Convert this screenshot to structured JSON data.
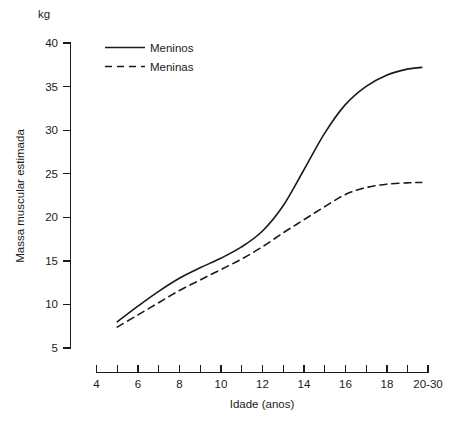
{
  "chart_data": {
    "type": "line",
    "title": "",
    "subtitle": "",
    "unit_label": "kg",
    "xlabel": "Idade (anos)",
    "ylabel": "Massa muscular estimada",
    "xlim": [
      4,
      20
    ],
    "ylim": [
      5,
      40
    ],
    "grid": false,
    "legend_position": "top-left-inside",
    "y_ticks": [
      5,
      10,
      15,
      20,
      25,
      30,
      35,
      40
    ],
    "y_tick_labels": [
      "5",
      "10",
      "15",
      "20",
      "25",
      "30",
      "35",
      "40"
    ],
    "x_ticks": [
      4,
      5,
      6,
      7,
      8,
      9,
      10,
      11,
      12,
      13,
      14,
      15,
      16,
      17,
      18,
      19,
      20
    ],
    "x_tick_labels": [
      "4",
      "",
      "6",
      "",
      "8",
      "",
      "10",
      "",
      "12",
      "",
      "14",
      "",
      "16",
      "",
      "18",
      "",
      "20-30"
    ],
    "x": [
      5,
      6,
      7,
      8,
      9,
      10,
      11,
      12,
      13,
      14,
      15,
      16,
      17,
      18,
      19,
      19.7
    ],
    "series": [
      {
        "name": "Meninos",
        "style": "solid",
        "color": "#1a1a1a",
        "values": [
          8.0,
          9.8,
          11.5,
          13.0,
          14.2,
          15.3,
          16.6,
          18.4,
          21.3,
          25.4,
          29.6,
          32.9,
          35.0,
          36.3,
          37.0,
          37.2
        ]
      },
      {
        "name": "Meninas",
        "style": "dashed",
        "color": "#1a1a1a",
        "values": [
          7.4,
          8.8,
          10.2,
          11.6,
          12.8,
          14.0,
          15.2,
          16.6,
          18.2,
          19.7,
          21.2,
          22.6,
          23.4,
          23.8,
          23.95,
          24.0
        ]
      }
    ],
    "annotations": []
  },
  "legend": {
    "items": [
      {
        "label": "Meninos",
        "style": "solid"
      },
      {
        "label": "Meninas",
        "style": "dashed"
      }
    ]
  },
  "axes": {
    "unit": "kg",
    "x_title": "Idade (anos)",
    "y_title": "Massa muscular estimada"
  }
}
